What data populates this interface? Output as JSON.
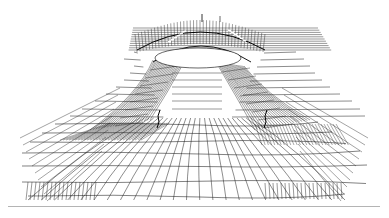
{
  "figure": {
    "kind": "wireframe-mesh",
    "line_color": "#1a1a1a",
    "dense_color": "#2b2b2b",
    "rule_color": "#b4b4b4",
    "ground": {
      "rows": [
        {
          "y": 196,
          "xl": 28,
          "xr": 345
        },
        {
          "y": 182,
          "xl": 22,
          "xr": 366
        },
        {
          "y": 166,
          "xl": 22,
          "xr": 367
        },
        {
          "y": 153,
          "xl": 22,
          "xr": 360
        },
        {
          "y": 142,
          "xl": 30,
          "xr": 346
        },
        {
          "y": 133,
          "xl": 42,
          "xr": 332
        },
        {
          "y": 124,
          "xl": 55,
          "xr": 318
        },
        {
          "y": 116,
          "xl": 70,
          "xr": 365
        },
        {
          "y": 109,
          "xl": 82,
          "xr": 360
        },
        {
          "y": 101,
          "xl": 95,
          "xr": 352
        },
        {
          "y": 94,
          "xl": 106,
          "xr": 340
        },
        {
          "y": 87,
          "xl": 116,
          "xr": 330
        },
        {
          "y": 80,
          "xl": 124,
          "xr": 322
        },
        {
          "y": 73,
          "xl": 130,
          "xr": 315
        },
        {
          "y": 66,
          "xl": 134,
          "xr": 310
        },
        {
          "y": 59,
          "xl": 124,
          "xr": 304
        },
        {
          "y": 52,
          "xl": 134,
          "xr": 296
        }
      ],
      "columns": 24,
      "vanish_x": 200
    },
    "arch": {
      "cx": 200,
      "cy": 54,
      "rx": 55,
      "ry": 33,
      "top": 20,
      "width_top": 90
    },
    "upper_deck": {
      "x1": 133,
      "x2": 318,
      "y1": 28,
      "y2": 52
    },
    "ridges": [
      {
        "side": "left",
        "top": [
          175,
          60
        ],
        "bottom": [
          120,
          130
        ]
      },
      {
        "side": "right",
        "top": [
          222,
          62
        ],
        "bottom": [
          285,
          130
        ]
      }
    ]
  }
}
